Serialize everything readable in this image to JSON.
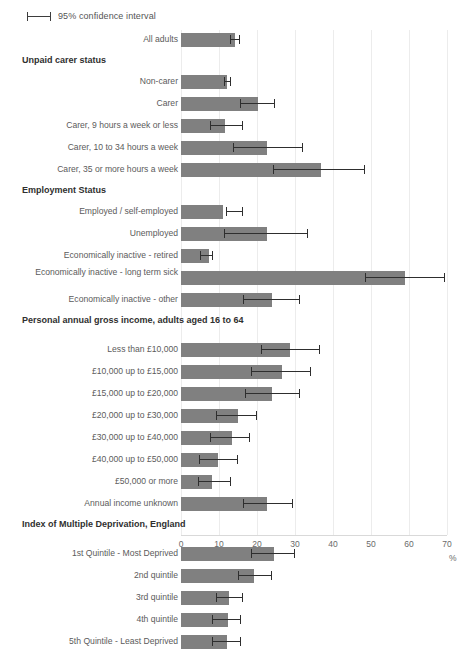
{
  "legend": {
    "label": "95% confidence interval",
    "glyph": "error-bar-icon"
  },
  "axis": {
    "title": "%",
    "ticks": [
      "0",
      "10",
      "20",
      "30",
      "40",
      "50",
      "60",
      "70"
    ]
  },
  "chart_data": {
    "type": "bar",
    "orientation": "horizontal",
    "title": "",
    "xlabel": "%",
    "ylabel": "",
    "xlim": [
      0,
      70
    ],
    "grid": true,
    "legend": "95% confidence interval",
    "error_bars": "95% confidence interval",
    "rows": [
      {
        "kind": "category",
        "label": "All adults",
        "value": 14.2,
        "ci_low": 13.0,
        "ci_high": 15.6
      },
      {
        "kind": "section",
        "label": "Unpaid carer status"
      },
      {
        "kind": "category",
        "label": "Non-carer",
        "value": 12.1,
        "ci_low": 11.2,
        "ci_high": 13.2
      },
      {
        "kind": "category",
        "label": "Carer",
        "value": 20.3,
        "ci_low": 15.5,
        "ci_high": 24.7
      },
      {
        "kind": "category",
        "label": "Carer, 9 hours a week or less",
        "value": 11.6,
        "ci_low": 7.6,
        "ci_high": 16.3
      },
      {
        "kind": "category",
        "label": "Carer, 10 to 34 hours a week",
        "value": 22.5,
        "ci_low": 13.8,
        "ci_high": 32.0
      },
      {
        "kind": "category",
        "label": "Carer, 35 or more hours a week",
        "value": 36.8,
        "ci_low": 24.2,
        "ci_high": 48.4
      },
      {
        "kind": "section",
        "label": "Employment Status"
      },
      {
        "kind": "category",
        "label": "Employed / self-employed",
        "value": 11.1,
        "ci_low": 11.8,
        "ci_high": 16.3
      },
      {
        "kind": "category",
        "label": "Unemployed",
        "value": 22.6,
        "ci_low": 11.3,
        "ci_high": 33.4
      },
      {
        "kind": "category",
        "label": "Economically inactive - retired",
        "value": 7.4,
        "ci_low": 5.0,
        "ci_high": 8.4
      },
      {
        "kind": "category",
        "label": "Economically inactive - long term sick",
        "value": 59.0,
        "ci_low": 48.4,
        "ci_high": 69.5,
        "twoline": true
      },
      {
        "kind": "category",
        "label": "Economically inactive - other",
        "value": 23.9,
        "ci_low": 16.3,
        "ci_high": 31.3
      },
      {
        "kind": "section2",
        "label": "Personal annual gross income, adults aged 16 to 64"
      },
      {
        "kind": "category",
        "label": "Less than £10,000",
        "value": 28.7,
        "ci_low": 21.1,
        "ci_high": 36.6
      },
      {
        "kind": "category",
        "label": "£10,000 up to £15,000",
        "value": 26.6,
        "ci_low": 18.4,
        "ci_high": 34.2
      },
      {
        "kind": "category",
        "label": "£15,000 up to £20,000",
        "value": 23.9,
        "ci_low": 16.8,
        "ci_high": 31.3
      },
      {
        "kind": "category",
        "label": "£20,000 up to £30,000",
        "value": 15.0,
        "ci_low": 9.2,
        "ci_high": 20.0
      },
      {
        "kind": "category",
        "label": "£30,000 up to £40,000",
        "value": 13.4,
        "ci_low": 7.6,
        "ci_high": 18.2
      },
      {
        "kind": "category",
        "label": "£40,000 up to £50,000",
        "value": 9.7,
        "ci_low": 4.7,
        "ci_high": 15.0
      },
      {
        "kind": "category",
        "label": "£50,000 or more",
        "value": 8.2,
        "ci_low": 4.5,
        "ci_high": 13.2
      },
      {
        "kind": "category",
        "label": "Annual income unknown",
        "value": 22.6,
        "ci_low": 16.3,
        "ci_high": 29.5
      },
      {
        "kind": "section2",
        "label": "Index of Multiple Deprivation, England"
      },
      {
        "kind": "category",
        "label": "1st Quintile - Most Deprived",
        "value": 24.5,
        "ci_low": 18.4,
        "ci_high": 30.0
      },
      {
        "kind": "category",
        "label": "2nd quintile",
        "value": 19.2,
        "ci_low": 15.0,
        "ci_high": 23.9
      },
      {
        "kind": "category",
        "label": "3rd quintile",
        "value": 12.6,
        "ci_low": 9.2,
        "ci_high": 16.3
      },
      {
        "kind": "category",
        "label": "4th quintile",
        "value": 12.4,
        "ci_low": 8.2,
        "ci_high": 15.8
      },
      {
        "kind": "category",
        "label": "5th Quintile - Least Deprived",
        "value": 12.1,
        "ci_low": 8.2,
        "ci_high": 15.8
      }
    ]
  },
  "colors": {
    "bar": "#808080",
    "error": "#2e2e2e",
    "grid": "#ececec",
    "label": "#5b5b5b",
    "section": "#2f2f2f"
  }
}
